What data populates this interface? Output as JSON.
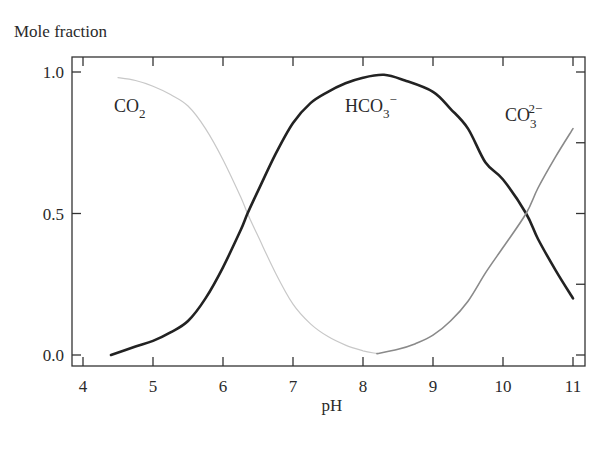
{
  "chart_data": {
    "type": "line",
    "title": "",
    "ylabel": "Mole fraction",
    "xlabel": "pH",
    "xlim": [
      3.85,
      11.17
    ],
    "ylim": [
      -0.04,
      1.05
    ],
    "x_ticks": [
      4,
      5,
      6,
      7,
      8,
      9,
      10,
      11
    ],
    "x_tick_labels": [
      "4",
      "5",
      "6",
      "7",
      "8",
      "9",
      "10",
      "11"
    ],
    "y_ticks": [
      0.0,
      0.5,
      1.0
    ],
    "y_tick_labels": [
      "0.0",
      "0.5",
      "1.0"
    ],
    "y_minor_ticks_right": [
      0.0,
      0.25,
      0.5,
      0.75,
      1.0
    ],
    "grid": false,
    "legend": "inline labels",
    "series": [
      {
        "name": "CO2",
        "label_main": "CO",
        "label_sub": "2",
        "label_sup": "",
        "color": "#c8c8c8",
        "width": 1.2,
        "x": [
          4.5,
          4.75,
          5.0,
          5.25,
          5.5,
          5.75,
          6.0,
          6.25,
          6.35,
          6.5,
          6.75,
          7.0,
          7.25,
          7.5,
          7.75,
          8.0,
          8.2
        ],
        "values": [
          0.98,
          0.97,
          0.95,
          0.92,
          0.88,
          0.8,
          0.69,
          0.56,
          0.5,
          0.42,
          0.29,
          0.18,
          0.11,
          0.065,
          0.035,
          0.015,
          0.005
        ]
      },
      {
        "name": "HCO3-",
        "label_main": "HCO",
        "label_sub": "3",
        "label_sup": "−",
        "color": "#222222",
        "width": 2.6,
        "x": [
          4.4,
          4.75,
          5.0,
          5.25,
          5.5,
          5.75,
          6.0,
          6.25,
          6.35,
          6.5,
          6.75,
          7.0,
          7.25,
          7.5,
          7.75,
          8.0,
          8.3,
          8.6,
          9.0,
          9.25,
          9.5,
          9.75,
          10.0,
          10.33,
          10.5,
          10.75,
          11.0
        ],
        "values": [
          0.0,
          0.03,
          0.05,
          0.08,
          0.12,
          0.2,
          0.31,
          0.44,
          0.5,
          0.58,
          0.71,
          0.82,
          0.89,
          0.93,
          0.96,
          0.98,
          0.99,
          0.97,
          0.93,
          0.87,
          0.8,
          0.68,
          0.62,
          0.5,
          0.41,
          0.3,
          0.2
        ]
      },
      {
        "name": "CO3 2-",
        "label_main": "CO",
        "label_sub": "3",
        "label_sup": "2−",
        "color": "#8a8a8a",
        "width": 1.6,
        "x": [
          8.2,
          8.5,
          8.75,
          9.0,
          9.25,
          9.5,
          9.75,
          10.0,
          10.33,
          10.5,
          10.75,
          11.0
        ],
        "values": [
          0.005,
          0.02,
          0.04,
          0.07,
          0.12,
          0.19,
          0.29,
          0.38,
          0.5,
          0.59,
          0.7,
          0.8
        ]
      }
    ],
    "annotations": [
      {
        "text": "CO2",
        "x": 4.55,
        "y": 0.88
      },
      {
        "text": "HCO3-",
        "x": 7.9,
        "y": 0.88
      },
      {
        "text": "CO3 2-",
        "x": 10.15,
        "y": 0.86
      }
    ]
  }
}
